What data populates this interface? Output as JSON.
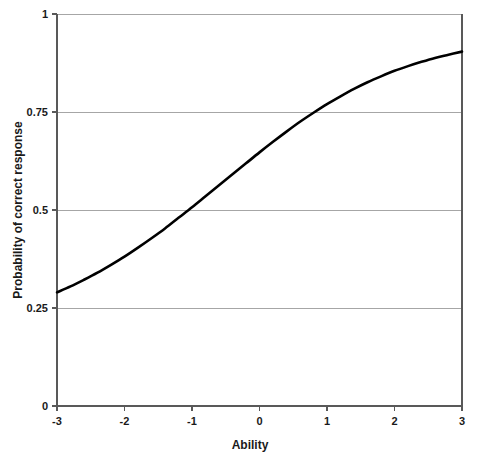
{
  "chart_data": {
    "type": "line",
    "title": "",
    "subtitle": "",
    "xlabel": "Ability",
    "ylabel": "Probability of correct response",
    "xlim": [
      -3,
      3
    ],
    "ylim": [
      0,
      1
    ],
    "xticks": [
      "-3",
      "-2",
      "-1",
      "0",
      "1",
      "2",
      "3"
    ],
    "xtick_values": [
      -3,
      -2,
      -1,
      0,
      1,
      2,
      3
    ],
    "yticks": [
      "0",
      "0.25",
      "0.5",
      "0.75",
      "1"
    ],
    "ytick_values": [
      0,
      0.25,
      0.5,
      0.75,
      1
    ],
    "grid": "horizontal",
    "legend": "none",
    "annotations": [],
    "series": [
      {
        "name": "Item characteristic curve",
        "color": "#000000",
        "x": [
          -3.0,
          -2.8,
          -2.6,
          -2.4,
          -2.2,
          -2.0,
          -1.8,
          -1.6,
          -1.4,
          -1.2,
          -1.0,
          -0.8,
          -0.6,
          -0.4,
          -0.2,
          0.0,
          0.2,
          0.4,
          0.6,
          0.8,
          1.0,
          1.2,
          1.4,
          1.6,
          1.8,
          2.0,
          2.2,
          2.4,
          2.6,
          2.8,
          3.0
        ],
        "values": [
          0.29,
          0.305,
          0.322,
          0.34,
          0.36,
          0.381,
          0.404,
          0.428,
          0.453,
          0.48,
          0.507,
          0.535,
          0.563,
          0.591,
          0.619,
          0.647,
          0.674,
          0.7,
          0.725,
          0.748,
          0.77,
          0.79,
          0.809,
          0.826,
          0.841,
          0.855,
          0.867,
          0.878,
          0.888,
          0.896,
          0.904
        ]
      }
    ]
  },
  "axes": {
    "x_title": "Ability",
    "y_title": "Probability of correct response"
  }
}
